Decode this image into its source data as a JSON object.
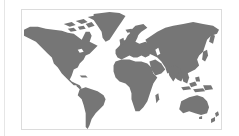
{
  "map": {
    "type": "world-map",
    "projection": "equirectangular-like",
    "colors": {
      "land": "#767676",
      "water": "#ffffff",
      "frame_border": "#dcdcdc",
      "side_rule": "#e6e6e6"
    },
    "regions": [
      "north-america",
      "greenland",
      "south-america",
      "europe",
      "africa",
      "asia",
      "australia",
      "new-zealand",
      "southeast-asia-islands"
    ]
  }
}
